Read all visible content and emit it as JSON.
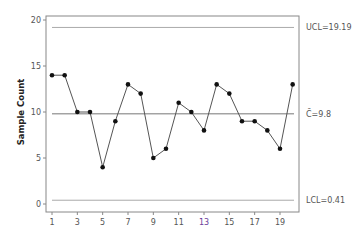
{
  "chart_data": {
    "type": "line",
    "title": "",
    "xlabel": "",
    "ylabel": "Sample Count",
    "x": [
      1,
      2,
      3,
      4,
      5,
      6,
      7,
      8,
      9,
      10,
      11,
      12,
      13,
      14,
      15,
      16,
      17,
      18,
      19,
      20
    ],
    "series": [
      {
        "name": "Sample Count",
        "values": [
          14,
          14,
          10,
          10,
          4,
          9,
          13,
          12,
          5,
          6,
          11,
          10,
          8,
          13,
          12,
          9,
          9,
          8,
          6,
          13
        ]
      }
    ],
    "x_tick_labels": [
      "1",
      "3",
      "5",
      "7",
      "9",
      "11",
      "13",
      "15",
      "17",
      "19"
    ],
    "y_tick_labels": [
      "0",
      "5",
      "10",
      "15",
      "20"
    ],
    "ylim": [
      0,
      20
    ],
    "xlim": [
      1,
      20
    ],
    "grid": false,
    "legend": null,
    "control_lines": {
      "ucl": {
        "value": 19.19,
        "label": "UCL=19.19"
      },
      "center": {
        "value": 9.8,
        "label": "C̄=9.8"
      },
      "lcl": {
        "value": 0.41,
        "label": "LCL=0.41"
      }
    },
    "highlighted_tick": {
      "label": "13",
      "color": "#6a3d9a"
    }
  },
  "colors": {
    "line": "#555555",
    "marker": "#111111",
    "frame": "#888888",
    "control_line": "#aaaaaa",
    "center_line": "#777777"
  }
}
